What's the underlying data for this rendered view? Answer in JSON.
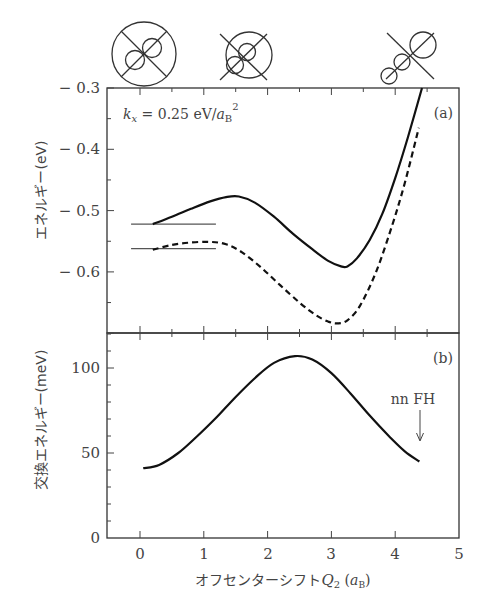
{
  "chart_data": [
    {
      "panel": "(a)",
      "type": "line",
      "xlabel": "オフセンターシフトQ2 (aB)",
      "ylabel": "エネルギー(eV)",
      "xlim": [
        -0.52,
        5
      ],
      "ylim": [
        -0.7,
        -0.3
      ],
      "yticks": [
        "-0.3",
        "-0.4",
        "-0.5",
        "-0.6"
      ],
      "annotation": "kx = 0.25 eV/aB²",
      "series": [
        {
          "name": "solid",
          "style": "solid",
          "x": [
            0.2,
            0.5,
            0.8,
            1.1,
            1.35,
            1.55,
            1.8,
            2.1,
            2.4,
            2.7,
            2.95,
            3.15,
            3.25,
            3.4,
            3.6,
            3.8,
            4.0,
            4.2,
            4.42
          ],
          "y": [
            -0.522,
            -0.51,
            -0.497,
            -0.485,
            -0.478,
            -0.477,
            -0.487,
            -0.51,
            -0.538,
            -0.563,
            -0.582,
            -0.591,
            -0.591,
            -0.578,
            -0.548,
            -0.505,
            -0.447,
            -0.38,
            -0.3
          ]
        },
        {
          "name": "dashed",
          "style": "dashed",
          "x": [
            0.2,
            0.5,
            0.8,
            1.1,
            1.35,
            1.6,
            1.9,
            2.2,
            2.5,
            2.75,
            2.95,
            3.1,
            3.25,
            3.45,
            3.7,
            3.95,
            4.15,
            4.37
          ],
          "y": [
            -0.564,
            -0.556,
            -0.552,
            -0.551,
            -0.555,
            -0.568,
            -0.593,
            -0.622,
            -0.65,
            -0.67,
            -0.681,
            -0.684,
            -0.679,
            -0.655,
            -0.6,
            -0.525,
            -0.455,
            -0.365
          ]
        }
      ],
      "reference_levels": [
        {
          "y": -0.522,
          "x_range": [
            -0.14,
            1.19
          ]
        },
        {
          "y": -0.562,
          "x_range": [
            -0.14,
            1.19
          ]
        }
      ]
    },
    {
      "panel": "(b)",
      "type": "line",
      "xlabel": "オフセンターシフトQ2 (aB)",
      "ylabel": "交換エネルギー(meV)",
      "xlim": [
        -0.52,
        5
      ],
      "ylim": [
        0,
        120
      ],
      "xticks": [
        "0",
        "1",
        "2",
        "3",
        "4",
        "5"
      ],
      "yticks": [
        "0",
        "50",
        "100"
      ],
      "annotation": "nn FH",
      "annotation_arrow_x": 4.35,
      "series": [
        {
          "name": "exchange energy",
          "style": "solid",
          "x": [
            0.05,
            0.3,
            0.6,
            0.9,
            1.2,
            1.5,
            1.8,
            2.1,
            2.43,
            2.7,
            3.0,
            3.3,
            3.6,
            3.9,
            4.15,
            4.38
          ],
          "y": [
            41,
            43,
            50,
            60,
            71,
            83,
            94,
            103,
            107,
            105,
            97,
            85,
            72,
            60,
            51,
            45
          ]
        }
      ]
    }
  ],
  "labels": {
    "panel_a": "(a)",
    "panel_b": "(b)",
    "kx_k": "k",
    "kx_sub": "x",
    "kx_rest": " = 0.25 eV/",
    "kx_a": "a",
    "kx_B": "B",
    "kx_sup": "2",
    "ylabel_a": "エネルギー(eV)",
    "ylabel_b": "交換エネルギー(meV)",
    "xlabel_main": "オフセンターシフト",
    "xlabel_Q": "Q",
    "xlabel_sub2": "2",
    "xlabel_unit_open": " (",
    "xlabel_unit_a": "a",
    "xlabel_unit_B": "B",
    "xlabel_unit_close": ")",
    "nnfh": "nn FH",
    "ya_ticks": [
      "− 0.3",
      "− 0.4",
      "− 0.5",
      "− 0.6"
    ],
    "yb_ticks": [
      "100",
      "50",
      "0"
    ],
    "x_ticks": [
      "0",
      "1",
      "2",
      "3",
      "4",
      "5"
    ]
  },
  "colors": {
    "curve": "#111111",
    "axis": "#333333",
    "text": "#444444"
  }
}
